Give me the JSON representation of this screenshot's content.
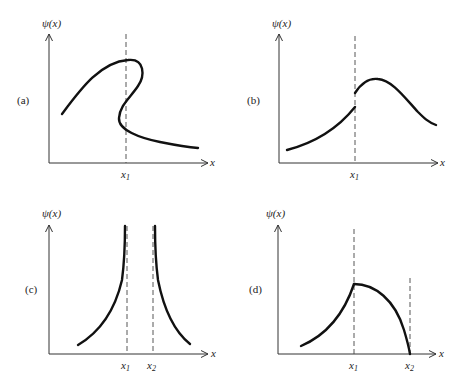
{
  "figure": {
    "panels": [
      {
        "id": "a",
        "label": "(a)",
        "ylabel": "ψ(x)",
        "xlabel": "x",
        "ticks": [
          "x1"
        ],
        "description": "Multivalued wavefunction folding back across x1"
      },
      {
        "id": "b",
        "label": "(b)",
        "ylabel": "ψ(x)",
        "xlabel": "x",
        "ticks": [
          "x1"
        ],
        "description": "Discontinuous wavefunction jumping at x1"
      },
      {
        "id": "c",
        "label": "(c)",
        "ylabel": "ψ(x)",
        "xlabel": "x",
        "ticks": [
          "x1",
          "x2"
        ],
        "description": "Wavefunction diverging to infinity at x1 and x2"
      },
      {
        "id": "d",
        "label": "(d)",
        "ylabel": "ψ(x)",
        "xlabel": "x",
        "ticks": [
          "x1",
          "x2"
        ],
        "description": "Wavefunction with kink at x1, falling to zero at x2"
      }
    ],
    "tick_text": {
      "x1_base": "x",
      "x1_sub": "1",
      "x2_base": "x",
      "x2_sub": "2"
    },
    "colors": {
      "curve": "#111111",
      "axis": "#333333",
      "dashed": "#444444"
    }
  }
}
